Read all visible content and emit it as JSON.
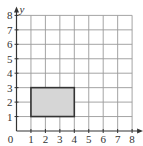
{
  "diagram": {
    "type": "coordinate-grid",
    "x_axis": {
      "label": "x",
      "min": 0,
      "max": 8,
      "ticks": [
        "1",
        "2",
        "3",
        "4",
        "5",
        "6",
        "7",
        "8"
      ]
    },
    "y_axis": {
      "label": "y",
      "min": 0,
      "max": 8,
      "ticks": [
        "1",
        "2",
        "3",
        "4",
        "5",
        "6",
        "7",
        "8"
      ]
    },
    "origin_label": "0",
    "shape": {
      "kind": "rectangle",
      "vertices": [
        [
          1,
          1
        ],
        [
          4,
          1
        ],
        [
          4,
          3
        ],
        [
          1,
          3
        ]
      ],
      "fill": "#d6d6d6",
      "stroke": "#333333"
    },
    "colors": {
      "grid": "#9a9a9a",
      "axis": "#333333"
    }
  }
}
